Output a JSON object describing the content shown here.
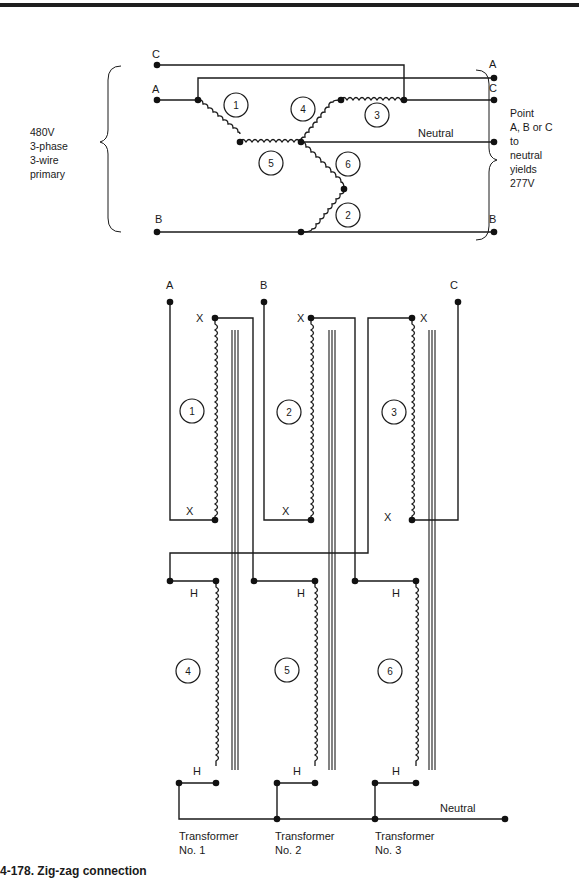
{
  "upper_diagram": {
    "terminal_labels": {
      "c_left": "C",
      "a_left": "A",
      "b_left": "B",
      "a_right": "A",
      "c_right": "C",
      "b_right": "B",
      "neutral": "Neutral"
    },
    "winding_numbers": [
      "1",
      "2",
      "3",
      "4",
      "5",
      "6"
    ],
    "left_note": [
      "480V",
      "3-phase",
      "3-wire",
      "primary"
    ],
    "right_note": [
      "Point",
      "A, B or C",
      "to",
      "neutral",
      "yields",
      "277V"
    ]
  },
  "lower_diagram": {
    "line_labels": {
      "a": "A",
      "b": "B",
      "c": "C"
    },
    "x_terminal_label": "X",
    "h_terminal_label": "H",
    "x_windings": [
      "1",
      "2",
      "3"
    ],
    "h_windings": [
      "4",
      "5",
      "6"
    ],
    "neutral_label": "Neutral",
    "transformers": [
      {
        "name": "Transformer",
        "number": "No. 1"
      },
      {
        "name": "Transformer",
        "number": "No. 2"
      },
      {
        "name": "Transformer",
        "number": "No. 3"
      }
    ]
  },
  "caption": "4-178. Zig-zag connection"
}
